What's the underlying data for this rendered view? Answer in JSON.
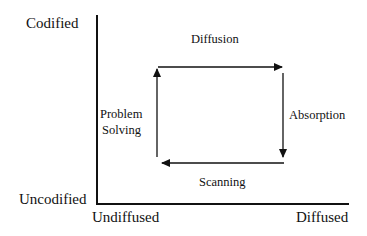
{
  "diagram": {
    "y_axis": {
      "top_label": "Codified",
      "bottom_label": "Uncodified"
    },
    "x_axis": {
      "left_label": "Undiffused",
      "right_label": "Diffused"
    },
    "cycle": {
      "top": "Diffusion",
      "right": "Absorption",
      "bottom": "Scanning",
      "left_line1": "Problem",
      "left_line2": "Solving"
    }
  }
}
